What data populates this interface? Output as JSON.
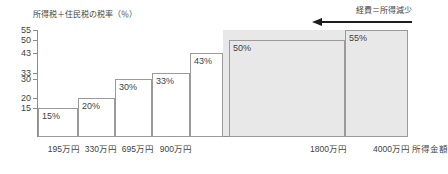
{
  "chart_data": {
    "type": "bar",
    "title": "",
    "ylabel": "所得税＋住民税の税率（％）",
    "xlabel": "所得金額",
    "ylim": [
      0,
      55
    ],
    "yticks": [
      "55",
      "50",
      "43",
      "33",
      "30",
      "20",
      "15"
    ],
    "ytick_values": [
      55,
      50,
      43,
      33,
      30,
      20,
      15
    ],
    "categories": [
      "195万円",
      "330万円",
      "695万円",
      "900万円",
      "1800万円",
      "4000万円",
      ""
    ],
    "values": [
      15,
      20,
      30,
      33,
      43,
      50,
      55
    ],
    "value_labels": [
      "15%",
      "20%",
      "30%",
      "33%",
      "43%",
      "50%",
      "55%"
    ],
    "xtick_labels": [
      "195万円",
      "330万円",
      "695万円",
      "900万円",
      "1800万円",
      "4000万円"
    ],
    "grid": false,
    "legend": "none",
    "annotation": "経費＝所得減少",
    "annotation_direction": "left-arrow",
    "shaded_region_note": "1800万円以上は網掛け",
    "colors": {
      "bar_fill": "#ffffff",
      "bar_fill_shaded": "#e8e8e8",
      "bar_stroke": "#9a9a9a",
      "axis": "#8d8d8d",
      "text": "#3f3f3f",
      "arrow": "#1d1d1d"
    }
  },
  "axis": {
    "y_title": "所得税＋住民税の税率（％）",
    "x_title": "所得金額"
  },
  "annotation": {
    "text": "経費＝所得減少"
  },
  "yticks": [
    {
      "label": "55",
      "value": 55
    },
    {
      "label": "50",
      "value": 50
    },
    {
      "label": "43",
      "value": 43
    },
    {
      "label": "33",
      "value": 33
    },
    {
      "label": "30",
      "value": 30
    },
    {
      "label": "20",
      "value": 20
    },
    {
      "label": "15",
      "value": 15
    }
  ],
  "bars": [
    {
      "label": "15%",
      "value": 15,
      "x_label": "195万円",
      "shaded": false
    },
    {
      "label": "20%",
      "value": 20,
      "x_label": "330万円",
      "shaded": false
    },
    {
      "label": "30%",
      "value": 30,
      "x_label": "695万円",
      "shaded": false
    },
    {
      "label": "33%",
      "value": 33,
      "x_label": "900万円",
      "shaded": false
    },
    {
      "label": "43%",
      "value": 43,
      "x_label": "",
      "shaded": false
    },
    {
      "label": "50%",
      "value": 50,
      "x_label": "1800万円",
      "shaded": true
    },
    {
      "label": "55%",
      "value": 55,
      "x_label": "4000万円",
      "shaded": true
    }
  ]
}
